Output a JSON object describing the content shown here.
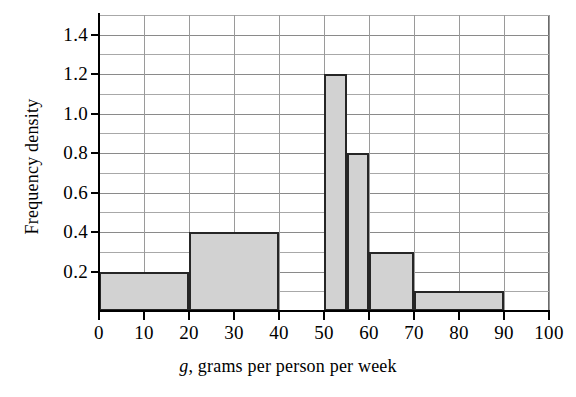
{
  "chart_data": {
    "type": "bar",
    "title": "",
    "subtitle": "",
    "xlabel": "g, grams per person per week",
    "xlabel_italic_prefix": "g",
    "xlabel_rest": ", grams per person per week",
    "ylabel": "Frequency density",
    "xlim": [
      0,
      100
    ],
    "ylim": [
      0,
      1.5
    ],
    "grid": true,
    "grid_x_step": 10,
    "grid_y_step": 0.1,
    "legend": "none",
    "x_tick_labels": [
      "0",
      "10",
      "20",
      "30",
      "40",
      "50",
      "60",
      "70",
      "80",
      "90",
      "100"
    ],
    "x_tick_values": [
      0,
      10,
      20,
      30,
      40,
      50,
      60,
      70,
      80,
      90,
      100
    ],
    "y_tick_labels": [
      "1.4",
      "1.2",
      "1.0",
      "0.8",
      "0.6",
      "0.4",
      "0.2"
    ],
    "y_tick_values": [
      1.4,
      1.2,
      1.0,
      0.8,
      0.6,
      0.4,
      0.2
    ],
    "y_minor_gridlines": [
      0.1,
      0.2,
      0.3,
      0.4,
      0.5,
      0.6,
      0.7,
      0.8,
      0.9,
      1.0,
      1.1,
      1.2,
      1.3,
      1.4,
      1.5
    ],
    "bars": [
      {
        "label": "0-20",
        "x_start": 0,
        "x_end": 20,
        "value": 0.2
      },
      {
        "label": "20-40",
        "x_start": 20,
        "x_end": 40,
        "value": 0.4
      },
      {
        "label": "50-55",
        "x_start": 50,
        "x_end": 55,
        "value": 1.2
      },
      {
        "label": "55-60",
        "x_start": 55,
        "x_end": 60,
        "value": 0.8
      },
      {
        "label": "60-70",
        "x_start": 60,
        "x_end": 70,
        "value": 0.3
      },
      {
        "label": "70-90",
        "x_start": 70,
        "x_end": 90,
        "value": 0.1
      }
    ],
    "colors": {
      "bar_fill": "#d2d2d2",
      "bar_edge": "#262626",
      "axis": "#000000",
      "gridline": "#a8a8a8",
      "background": "#ffffff",
      "text": "#000000"
    }
  }
}
